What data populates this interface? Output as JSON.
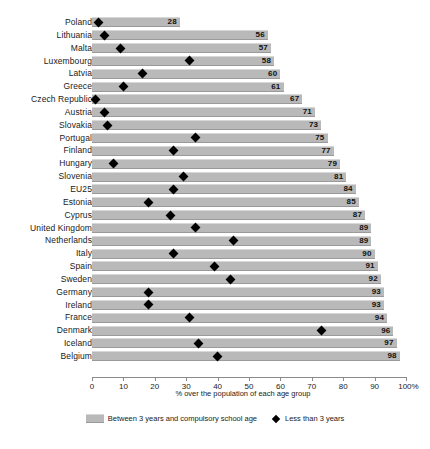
{
  "chart_data": {
    "type": "bar",
    "title": "",
    "xlabel": "% over the population of each age group",
    "ylabel": "",
    "xlim": [
      0,
      100
    ],
    "grid": false,
    "legend_position": "bottom-center",
    "categories": [
      "Poland",
      "Lithuania",
      "Malta",
      "Luxembourg",
      "Latvia",
      "Greece",
      "Czech Republic",
      "Austria",
      "Slovakia",
      "Portugal",
      "Finland",
      "Hungary",
      "Slovenia",
      "EU25",
      "Estonia",
      "Cyprus",
      "United Kingdom",
      "Netherlands",
      "Italy",
      "Spain",
      "Sweden",
      "Germany",
      "Ireland",
      "France",
      "Denmark",
      "Iceland",
      "Belgium"
    ],
    "series": [
      {
        "name": "Between 3 years and compulsory school age",
        "type": "bar",
        "values": [
          28,
          56,
          57,
          58,
          60,
          61,
          67,
          71,
          73,
          75,
          77,
          79,
          81,
          84,
          85,
          87,
          89,
          89,
          90,
          91,
          92,
          93,
          93,
          94,
          96,
          97,
          98
        ]
      },
      {
        "name": "Less than 3 years",
        "type": "marker",
        "values": [
          2,
          4,
          9,
          31,
          16,
          10,
          1,
          4,
          5,
          33,
          26,
          7,
          29,
          26,
          18,
          25,
          33,
          45,
          26,
          39,
          44,
          18,
          18,
          31,
          73,
          34,
          40
        ]
      }
    ],
    "xticks": [
      0,
      10,
      20,
      30,
      40,
      50,
      60,
      70,
      80,
      90,
      100
    ],
    "xtick_labels": [
      "0",
      "10",
      "20",
      "30",
      "40",
      "50",
      "60",
      "70",
      "80",
      "90",
      "100%"
    ],
    "colors": {
      "bar": "#b9b9b9",
      "marker": "#000000",
      "axis": "#8a8a8a",
      "text": "#1a1a1a",
      "background": "#ffffff"
    }
  },
  "legend": {
    "bar_label": "Between 3 years and compulsory school age",
    "marker_label": "Less than 3 years"
  }
}
